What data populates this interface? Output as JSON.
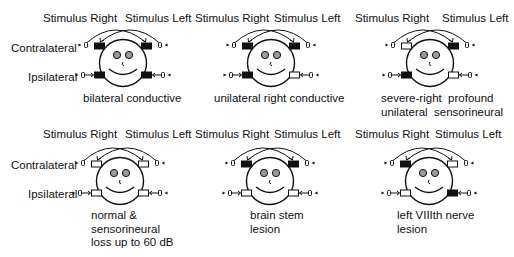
{
  "figure": {
    "row_labels": {
      "contralateral": "Contralateral",
      "ipsilateral": "Ipsilateral"
    },
    "stimulus_right_label": "Stimulus Right",
    "stimulus_left_label": "Stimulus Left",
    "colors": {
      "ink": "#111111",
      "filled_box": "#111111",
      "empty_box": "#ffffff",
      "eye_fill": "#9a9a9a",
      "background": "#ffffff"
    },
    "legend_semantics": {
      "filled_box": "reflex absent",
      "empty_box": "reflex present"
    },
    "panels": [
      {
        "id": "bilateral-conductive",
        "caption": [
          "bilateral conductive"
        ],
        "boxes": {
          "contra_right_ear": "filled",
          "contra_left_ear": "filled",
          "ipsi_right_ear": "filled",
          "ipsi_left_ear": "filled"
        }
      },
      {
        "id": "unilateral-right-conductive",
        "caption": [
          "unilateral right conductive"
        ],
        "boxes": {
          "contra_right_ear": "filled",
          "contra_left_ear": "filled",
          "ipsi_right_ear": "filled",
          "ipsi_left_ear": "empty"
        }
      },
      {
        "id": "severe-right-profound-unilateral-sensorineural",
        "caption": [
          "severe-right  profound",
          "unilateral  sensorineural"
        ],
        "boxes": {
          "contra_right_ear": "empty",
          "contra_left_ear": "filled",
          "ipsi_right_ear": "filled",
          "ipsi_left_ear": "empty"
        }
      },
      {
        "id": "normal-sensorineural",
        "caption": [
          "normal &",
          "sensorineural",
          "loss up to 60 dB"
        ],
        "boxes": {
          "contra_right_ear": "empty",
          "contra_left_ear": "empty",
          "ipsi_right_ear": "empty",
          "ipsi_left_ear": "empty"
        }
      },
      {
        "id": "brain-stem-lesion",
        "caption": [
          "brain stem",
          "lesion"
        ],
        "boxes": {
          "contra_right_ear": "filled",
          "contra_left_ear": "filled",
          "ipsi_right_ear": "empty",
          "ipsi_left_ear": "empty"
        }
      },
      {
        "id": "left-viiith-nerve-lesion",
        "caption": [
          "left VIIIth nerve",
          "lesion"
        ],
        "boxes": {
          "contra_right_ear": "filled",
          "contra_left_ear": "empty",
          "ipsi_right_ear": "empty",
          "ipsi_left_ear": "filled"
        }
      }
    ]
  }
}
